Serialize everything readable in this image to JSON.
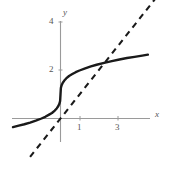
{
  "figure": {
    "background_color": "#ffffff",
    "width": 169,
    "height": 170
  },
  "axes": {
    "x_axis_label": "x",
    "y_axis_label": "y",
    "x_tick_labels": [
      "1",
      "3"
    ],
    "y_tick_labels": [
      "2",
      "4"
    ],
    "axis_color": "#8a8a8a"
  },
  "labels": {
    "y_tick_4": "4",
    "y_tick_2": "2",
    "x_tick_1": "1",
    "x_tick_3": "3",
    "y_axis_name": "y",
    "x_axis_name": "x"
  },
  "chart_data": {
    "type": "line",
    "title": "",
    "xlabel": "x",
    "ylabel": "y",
    "xlim": [
      -2.5,
      4.6
    ],
    "ylim": [
      -1.3,
      4.9
    ],
    "grid": false,
    "legend": "none",
    "x_ticks": [
      1,
      3
    ],
    "y_ticks": [
      2,
      4
    ],
    "x_tick_labels": [
      "1",
      "3"
    ],
    "y_tick_labels": [
      "2",
      "4"
    ],
    "annotations": [
      {
        "text": "curve and dashed line intersect",
        "x": 2.3,
        "y": 1.8
      }
    ],
    "series": [
      {
        "name": "solid-curve",
        "style": "solid",
        "color": "#1a1a1a",
        "linewidth": 2.2,
        "description": "S-shaped cube-root style curve y = 1 + cbrt(x) passing near (0,1)",
        "x": [
          -2.5,
          -2.2,
          -1.9,
          -1.6,
          -1.3,
          -1.0,
          -0.8,
          -0.6,
          -0.45,
          -0.3,
          -0.2,
          -0.12,
          -0.06,
          -0.02,
          0.0,
          0.02,
          0.06,
          0.12,
          0.2,
          0.3,
          0.45,
          0.6,
          0.8,
          1.0,
          1.3,
          1.6,
          1.9,
          2.3,
          2.7,
          3.1,
          3.5,
          3.9,
          4.3,
          4.6
        ],
        "y": [
          -0.36,
          -0.3,
          -0.24,
          -0.17,
          -0.09,
          0.0,
          0.07,
          0.16,
          0.23,
          0.33,
          0.42,
          0.51,
          0.61,
          0.73,
          1.0,
          1.27,
          1.39,
          1.49,
          1.58,
          1.67,
          1.77,
          1.84,
          1.93,
          2.0,
          2.09,
          2.17,
          2.24,
          2.32,
          2.39,
          2.46,
          2.52,
          2.57,
          2.62,
          2.66
        ]
      },
      {
        "name": "dashed-line",
        "style": "dashed",
        "color": "#1a1a1a",
        "linewidth": 2.2,
        "description": "straight reference line y = x through the origin",
        "x": [
          -1.6,
          5.0
        ],
        "y": [
          -1.6,
          5.0
        ]
      }
    ]
  }
}
